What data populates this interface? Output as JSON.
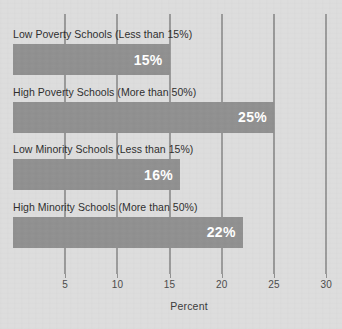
{
  "chart_data": {
    "type": "bar",
    "orientation": "horizontal",
    "title": "",
    "xlabel": "Percent",
    "ylabel": "",
    "xlim": [
      0,
      31
    ],
    "grid": true,
    "legend": "none",
    "xticks": [
      "5",
      "10",
      "15",
      "20",
      "25",
      "30"
    ],
    "xtick_values": [
      5,
      10,
      15,
      20,
      25,
      30
    ],
    "categories": [
      "Low Poverty Schools (Less than 15%)",
      "High Poverty Schools (More than 50%)",
      "Low Minority Schools (Less than 15%)",
      "High Minority Schools (More than 50%)"
    ],
    "values": [
      15,
      25,
      16,
      22
    ],
    "value_labels": [
      "15%",
      "25%",
      "16%",
      "22%"
    ],
    "bars": [
      {
        "label": "Low Poverty Schools (Less than 15%)",
        "value": 15,
        "value_label": "15%"
      },
      {
        "label": "High Poverty Schools (More than 50%)",
        "value": 25,
        "value_label": "25%"
      },
      {
        "label": "Low Minority Schools (Less than 15%)",
        "value": 16,
        "value_label": "16%"
      },
      {
        "label": "High Minority Schools (More than 50%)",
        "value": 22,
        "value_label": "22%"
      }
    ],
    "colors": {
      "background": "#dddddd",
      "bar": "#909090",
      "gridline": "#9a9a9a",
      "value_text": "#ffffff",
      "label_text": "#2e2e2e",
      "tick_text": "#4b4b4b"
    }
  }
}
